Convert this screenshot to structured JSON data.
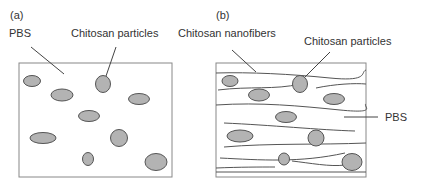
{
  "panel_a": {
    "tag": "(a)",
    "labels": {
      "matrix": "PBS",
      "particles": "Chitosan particles"
    }
  },
  "panel_b": {
    "tag": "(b)",
    "labels": {
      "fibers": "Chitosan nanofibers",
      "particles": "Chitosan particles",
      "matrix": "PBS"
    }
  },
  "colors": {
    "particle_fill": "#b3b3b3",
    "particle_stroke": "#555555",
    "line": "#444444",
    "border": "#888888"
  }
}
